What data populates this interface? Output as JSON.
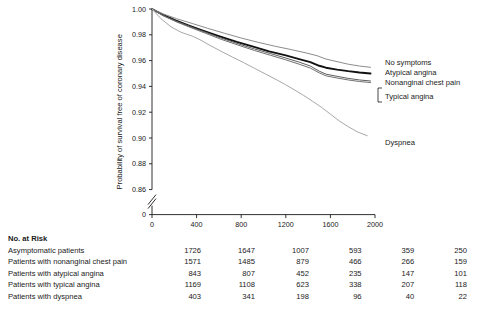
{
  "chart_data": {
    "type": "line",
    "title": "",
    "xlabel": "Days",
    "ylabel": "Probability of survival free of coronary disease",
    "xlim": [
      0,
      2000
    ],
    "ylim": [
      0.85,
      1.0
    ],
    "xticks": [
      "0",
      "400",
      "800",
      "1200",
      "1600",
      "2000"
    ],
    "yticks": [
      "0",
      "0.86",
      "0.88",
      "0.90",
      "0.92",
      "0.94",
      "0.96",
      "0.98",
      "1.00"
    ],
    "axis_break": true,
    "grid": false,
    "legend_position": "right-inline",
    "series": [
      {
        "name": "No symptoms",
        "color": "#111111",
        "width": 1.9,
        "points": [
          [
            0,
            1.0
          ],
          [
            100,
            0.9955
          ],
          [
            200,
            0.9915
          ],
          [
            320,
            0.9875
          ],
          [
            450,
            0.9835
          ],
          [
            600,
            0.979
          ],
          [
            760,
            0.9745
          ],
          [
            900,
            0.971
          ],
          [
            1050,
            0.9672
          ],
          [
            1200,
            0.964
          ],
          [
            1320,
            0.9612
          ],
          [
            1420,
            0.9588
          ],
          [
            1500,
            0.956
          ],
          [
            1560,
            0.9545
          ],
          [
            1660,
            0.953
          ],
          [
            1760,
            0.9518
          ],
          [
            1860,
            0.9508
          ],
          [
            1960,
            0.95
          ]
        ]
      },
      {
        "name": "Atypical angina",
        "color": "#8c8c8c",
        "width": 1.0,
        "points": [
          [
            0,
            1.0
          ],
          [
            100,
            0.9962
          ],
          [
            220,
            0.9925
          ],
          [
            360,
            0.9888
          ],
          [
            500,
            0.985
          ],
          [
            650,
            0.9812
          ],
          [
            800,
            0.9775
          ],
          [
            950,
            0.9742
          ],
          [
            1100,
            0.9712
          ],
          [
            1250,
            0.9685
          ],
          [
            1380,
            0.966
          ],
          [
            1480,
            0.9638
          ],
          [
            1560,
            0.9612
          ],
          [
            1660,
            0.9592
          ],
          [
            1760,
            0.9572
          ],
          [
            1860,
            0.9558
          ],
          [
            1960,
            0.9548
          ]
        ]
      },
      {
        "name": "Nonanginal chest pain",
        "color": "#5e5e5e",
        "width": 1.0,
        "points": [
          [
            0,
            1.0
          ],
          [
            100,
            0.995
          ],
          [
            220,
            0.9905
          ],
          [
            350,
            0.9862
          ],
          [
            480,
            0.982
          ],
          [
            620,
            0.9775
          ],
          [
            780,
            0.9728
          ],
          [
            920,
            0.969
          ],
          [
            1060,
            0.9655
          ],
          [
            1200,
            0.962
          ],
          [
            1320,
            0.9588
          ],
          [
            1420,
            0.9558
          ],
          [
            1500,
            0.9518
          ],
          [
            1560,
            0.9495
          ],
          [
            1660,
            0.9478
          ],
          [
            1760,
            0.9462
          ],
          [
            1860,
            0.945
          ],
          [
            1960,
            0.9442
          ]
        ]
      },
      {
        "name": "Typical angina",
        "color": "#707070",
        "width": 1.0,
        "points": [
          [
            0,
            1.0
          ],
          [
            100,
            0.9948
          ],
          [
            220,
            0.99
          ],
          [
            350,
            0.9855
          ],
          [
            480,
            0.9812
          ],
          [
            620,
            0.9765
          ],
          [
            780,
            0.9718
          ],
          [
            920,
            0.9678
          ],
          [
            1060,
            0.9642
          ],
          [
            1200,
            0.9606
          ],
          [
            1320,
            0.9572
          ],
          [
            1420,
            0.9542
          ],
          [
            1500,
            0.9505
          ],
          [
            1560,
            0.9482
          ],
          [
            1660,
            0.9465
          ],
          [
            1760,
            0.945
          ],
          [
            1860,
            0.9438
          ],
          [
            1960,
            0.943
          ]
        ]
      },
      {
        "name": "Dyspnea",
        "color": "#a8a8a8",
        "width": 1.0,
        "points": [
          [
            0,
            1.0
          ],
          [
            80,
            0.9925
          ],
          [
            170,
            0.9862
          ],
          [
            260,
            0.982
          ],
          [
            360,
            0.979
          ],
          [
            430,
            0.9762
          ],
          [
            520,
            0.9718
          ],
          [
            620,
            0.9672
          ],
          [
            720,
            0.9628
          ],
          [
            820,
            0.9585
          ],
          [
            920,
            0.954
          ],
          [
            1020,
            0.9495
          ],
          [
            1120,
            0.945
          ],
          [
            1200,
            0.9412
          ],
          [
            1280,
            0.9372
          ],
          [
            1360,
            0.933
          ],
          [
            1440,
            0.9285
          ],
          [
            1520,
            0.9238
          ],
          [
            1600,
            0.9185
          ],
          [
            1680,
            0.9132
          ],
          [
            1760,
            0.9088
          ],
          [
            1840,
            0.9048
          ],
          [
            1930,
            0.9018
          ]
        ]
      }
    ]
  },
  "risk_table": {
    "title": "No. at Risk",
    "columns": [
      "0",
      "400",
      "800",
      "1200",
      "1600",
      "2000"
    ],
    "rows": [
      {
        "label": "Asymptomatic patients",
        "values": [
          "1726",
          "1647",
          "1007",
          "593",
          "359",
          "250"
        ]
      },
      {
        "label": "Patients with nonanginal chest pain",
        "values": [
          "1571",
          "1485",
          "879",
          "466",
          "266",
          "159"
        ]
      },
      {
        "label": "Patients with atypical angina",
        "values": [
          "843",
          "807",
          "452",
          "235",
          "147",
          "101"
        ]
      },
      {
        "label": "Patients with typical angina",
        "values": [
          "1169",
          "1108",
          "623",
          "338",
          "207",
          "118"
        ]
      },
      {
        "label": "Patients with dyspnea",
        "values": [
          "403",
          "341",
          "198",
          "96",
          "40",
          "22"
        ]
      }
    ]
  }
}
